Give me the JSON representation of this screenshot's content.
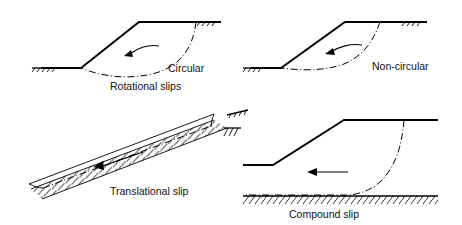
{
  "figure": {
    "background_color": "#ffffff",
    "line_color": "#000000",
    "width": 462,
    "height": 225
  },
  "panels": [
    {
      "id": "circular",
      "label": "Circular",
      "label_x": 168,
      "label_y": 72,
      "slip_type": "circular-arc",
      "arrow_direction": "left",
      "description": "Embankment slope with circular rotational slip surface"
    },
    {
      "id": "non-circular",
      "label": "Non-circular",
      "label_x": 372,
      "label_y": 70,
      "slip_type": "non-circular-arc",
      "arrow_direction": "left",
      "description": "Embankment slope with non-circular rotational slip surface"
    },
    {
      "id": "translational",
      "label": "Translational slip",
      "label_x": 110,
      "label_y": 195,
      "slip_type": "planar",
      "arrow_direction": "left",
      "description": "Inclined stratum with planar translational slip surface above hatched boundary"
    },
    {
      "id": "compound",
      "label": "Compound slip",
      "label_x": 289,
      "label_y": 218,
      "slip_type": "compound",
      "arrow_direction": "left",
      "description": "Embankment over firm stratum with compound slip surface"
    }
  ],
  "group_captions": [
    {
      "id": "rotational-slips",
      "text": "Rotational slips",
      "x": 144,
      "y": 90
    }
  ]
}
